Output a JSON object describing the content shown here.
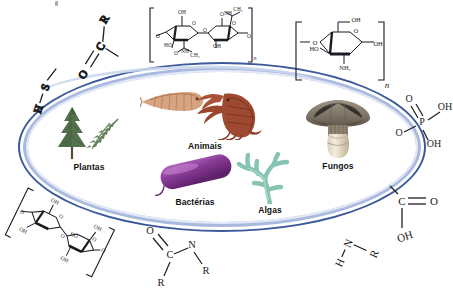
{
  "figure": {
    "center_shape": "ellipse",
    "colors": {
      "ring_outer": "#3c5a9a",
      "ring_inner": "#aabadf",
      "ring_gloss": "#e3e9f6",
      "background": "#ffffff",
      "label_text": "#111111"
    }
  },
  "organisms": [
    {
      "id": "plantas",
      "label": "Plantas",
      "icon": "conifer-tree-and-fern-icon",
      "colors": {
        "primary": "#4d6b4a",
        "secondary": "#6d8a63"
      }
    },
    {
      "id": "animais",
      "label": "Animais",
      "icon": "shrimp-and-lobster-icon",
      "colors": {
        "primary": "#9c4a33",
        "secondary": "#c98f6e"
      }
    },
    {
      "id": "bacterias",
      "label": "Bactérias",
      "icon": "rod-bacterium-icon",
      "colors": {
        "primary": "#7b2f86",
        "secondary": "#a755b4"
      }
    },
    {
      "id": "algas",
      "label": "Algas",
      "icon": "seaweed-icon",
      "colors": {
        "primary": "#7fbfae",
        "secondary": "#a8d6c8"
      }
    },
    {
      "id": "fungos",
      "label": "Fungos",
      "icon": "mushroom-icon",
      "colors": {
        "primary": "#8a8175",
        "secondary": "#efe8d6"
      }
    }
  ],
  "chemistry": [
    {
      "id": "carbonyl",
      "name": "carbonyl-group",
      "position": "top-left",
      "atoms": [
        "O",
        "C",
        "R"
      ],
      "bonds": "O=C-R"
    },
    {
      "id": "thiol",
      "name": "thiol-group",
      "position": "left",
      "atoms": [
        "H",
        "S"
      ],
      "bonds": "H-S-"
    },
    {
      "id": "chitin",
      "name": "chitin-repeat-unit",
      "position": "top-center",
      "atoms": [
        "OH",
        "O",
        "HO",
        "NH",
        "CH3",
        "n"
      ],
      "bonds": "polysaccharide"
    },
    {
      "id": "chitosan",
      "name": "chitosan-repeat-unit",
      "position": "top-right",
      "atoms": [
        "OH",
        "O",
        "HO",
        "NH2",
        "OH",
        "n"
      ],
      "bonds": "polysaccharide"
    },
    {
      "id": "phosphate",
      "name": "phosphate-group",
      "position": "right",
      "atoms": [
        "O",
        "P",
        "OH",
        "OH",
        "O"
      ],
      "bonds": "O=P(OH)(OH)-O-"
    },
    {
      "id": "carboxyl",
      "name": "carboxyl-group",
      "position": "bottom-right",
      "atoms": [
        "C",
        "O",
        "OH"
      ],
      "bonds": "C(=O)-OH"
    },
    {
      "id": "amine",
      "name": "amine-group",
      "position": "bottom-right-lower",
      "atoms": [
        "H",
        "N",
        "R"
      ],
      "bonds": "HN-R"
    },
    {
      "id": "amide",
      "name": "amide-group",
      "position": "bottom-center",
      "atoms": [
        "O",
        "C",
        "N",
        "R",
        "R"
      ],
      "bonds": "O=C(R)-N-R"
    },
    {
      "id": "cellulose",
      "name": "cellulose-repeat-unit",
      "position": "bottom-left",
      "atoms": [
        "OH",
        "O",
        "HO",
        "OH",
        "OH"
      ],
      "bonds": "polysaccharide"
    }
  ],
  "labels": {
    "O": "O",
    "C": "C",
    "R": "R",
    "H": "H",
    "S": "S",
    "P": "P",
    "N": "N",
    "OH": "OH",
    "HO": "HO",
    "NH": "NH",
    "NH2": "NH₂",
    "CH3": "CH₃",
    "n": "n"
  }
}
